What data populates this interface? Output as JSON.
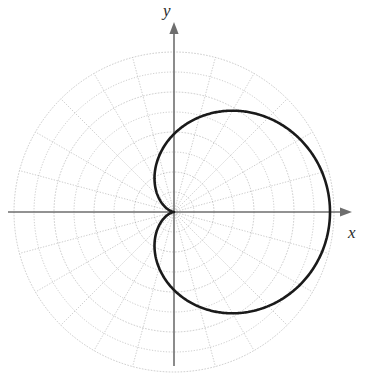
{
  "figure": {
    "kind": "polar-plot",
    "background_color": "#ffffff",
    "width": 367,
    "height": 373
  },
  "axes": {
    "x_label": "x",
    "y_label": "y",
    "axis_color": "#6e6e6e",
    "axis_line_width": 1.6,
    "arrowheads": true,
    "origin": {
      "x": 174,
      "y": 212
    },
    "x_axis_extent": {
      "start_x": 8,
      "end_x": 352
    },
    "y_axis_extent": {
      "start_y": 366,
      "end_y": 22
    }
  },
  "polar_grid": {
    "visible": true,
    "grid_color": "#9a9a9a",
    "grid_line_width": 0.6,
    "grid_style": "dotted-thin",
    "outer_radius_px": 160,
    "circle_count": 8,
    "circle_radii_px": [
      20,
      40,
      60,
      80,
      100,
      120,
      140,
      160
    ],
    "spoke_count": 24,
    "spoke_step_degrees": 15
  },
  "curve": {
    "color": "#1a1a1a",
    "line_width": 2.6,
    "equation": "r = a(1 + cos(theta))",
    "name": "cardioid",
    "a_px": 78,
    "max_radius_px": 156,
    "theta_start_deg": 0,
    "theta_end_deg": 360
  },
  "chart_data": {
    "type": "line",
    "title": "",
    "subtitle": "",
    "xlabel": "x",
    "ylabel": "y",
    "coordinate_system": "polar",
    "grid": true,
    "legend": false,
    "legend_position": "none",
    "xlim": [
      -2.05,
      2.05
    ],
    "ylim": [
      -2.05,
      2.05
    ],
    "radial_ticks": [
      0.25,
      0.5,
      0.75,
      1.0,
      1.25,
      1.5,
      1.75,
      2.0
    ],
    "angular_ticks_deg": [
      0,
      15,
      30,
      45,
      60,
      75,
      90,
      105,
      120,
      135,
      150,
      165,
      180,
      195,
      210,
      225,
      240,
      255,
      270,
      285,
      300,
      315,
      330,
      345
    ],
    "series": [
      {
        "name": "r = 1 + cos(theta)",
        "curve_type": "cardioid",
        "theta_deg": [
          0,
          15,
          30,
          45,
          60,
          75,
          90,
          105,
          120,
          135,
          150,
          165,
          180,
          195,
          210,
          225,
          240,
          255,
          270,
          285,
          300,
          315,
          330,
          345,
          360
        ],
        "r": [
          2.0,
          1.966,
          1.866,
          1.707,
          1.5,
          1.259,
          1.0,
          0.741,
          0.5,
          0.293,
          0.134,
          0.034,
          0.0,
          0.034,
          0.134,
          0.293,
          0.5,
          0.741,
          1.0,
          1.259,
          1.5,
          1.707,
          1.866,
          1.966,
          2.0
        ],
        "x": [
          2.0,
          1.899,
          1.616,
          1.207,
          0.75,
          0.326,
          0.0,
          -0.192,
          -0.25,
          -0.207,
          -0.116,
          -0.033,
          0.0,
          -0.033,
          -0.116,
          -0.207,
          -0.25,
          -0.192,
          0.0,
          0.326,
          0.75,
          1.207,
          1.616,
          1.899,
          2.0
        ],
        "y": [
          0.0,
          0.509,
          0.933,
          1.207,
          1.299,
          1.216,
          1.0,
          0.716,
          0.433,
          0.207,
          0.067,
          0.009,
          0.0,
          -0.009,
          -0.067,
          -0.207,
          -0.433,
          -0.716,
          -1.0,
          -1.216,
          -1.299,
          -1.207,
          -0.933,
          -0.509,
          0.0
        ],
        "notable_points": {
          "rightmost_x": 2.0,
          "max_y": 1.299,
          "min_y": -1.299,
          "cusp_at_origin": true,
          "cusp_theta_deg": 180
        }
      }
    ]
  }
}
